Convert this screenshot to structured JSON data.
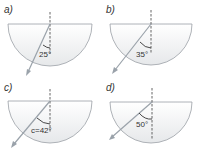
{
  "colors": {
    "block_fill": "#f2f3f4",
    "block_stroke": "#9aa0a6",
    "ray": "#9aa2aa",
    "normal": "#555555",
    "text": "#333333"
  },
  "panels": [
    {
      "label": "a)",
      "angle_label": "25°",
      "angle_deg": 25
    },
    {
      "label": "b)",
      "angle_label": "35°",
      "angle_deg": 35
    },
    {
      "label": "c)",
      "angle_label": "c=42°",
      "angle_deg": 42
    },
    {
      "label": "d)",
      "angle_label": "50°",
      "angle_deg": 50
    }
  ]
}
